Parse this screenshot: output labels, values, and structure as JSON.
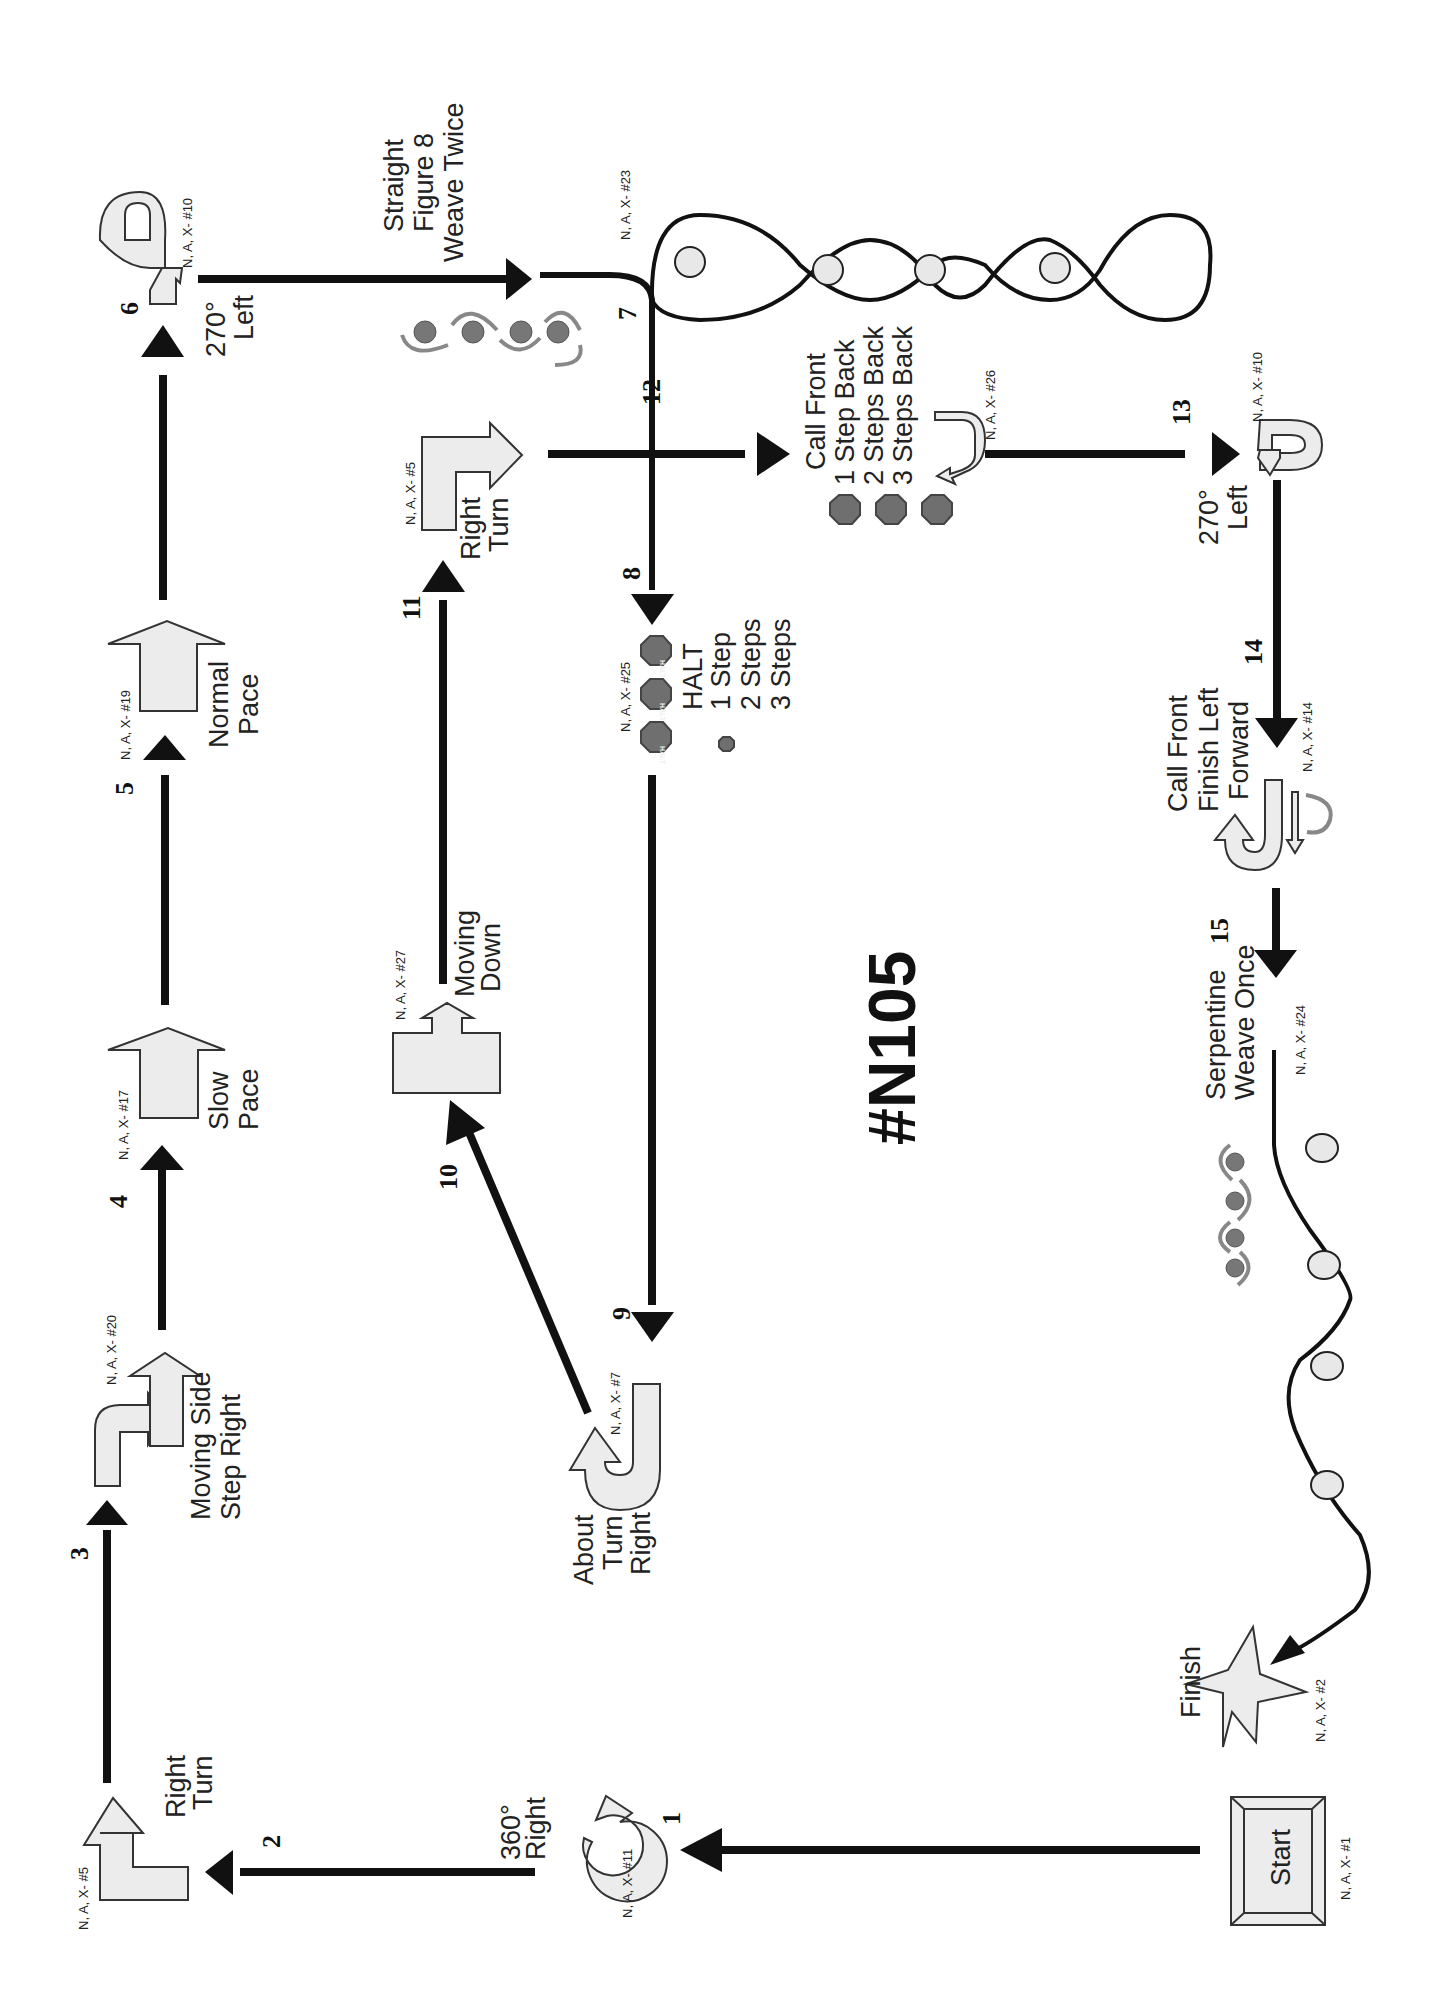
{
  "course": {
    "title": "#N105"
  },
  "stations": [
    {
      "step": "1",
      "name": "Start",
      "code": "N, A, X- #1"
    },
    {
      "step": "2",
      "name": "360° Right",
      "line1": "360°",
      "line2": "Right",
      "code": "N, A, X- #11"
    },
    {
      "step": "3",
      "name": "Right Turn",
      "line1": "Right",
      "line2": "Turn",
      "code": "N, A, X- #5"
    },
    {
      "step": "4",
      "name": "Moving Side Step Right",
      "line1": "Moving Side",
      "line2": "Step Right",
      "code": "N, A, X- #20"
    },
    {
      "step": "5",
      "name": "Slow Pace",
      "line1": "Slow",
      "line2": "Pace",
      "code": "N, A, X- #17"
    },
    {
      "step": "6",
      "name": "Normal Pace",
      "line1": "Normal",
      "line2": "Pace",
      "code": "N, A, X- #19"
    },
    {
      "step": "7",
      "name": "270° Left",
      "line1": "270°",
      "line2": "Left",
      "code": "N, A, X- #10"
    },
    {
      "step": "8",
      "name": "Straight Figure 8 Weave Twice",
      "line1": "Straight",
      "line2": "Figure 8",
      "line3": "Weave  Twice",
      "code": "N, A, X- #23"
    },
    {
      "step": "9",
      "name": "HALT 1 Step 2 Steps 3 Steps",
      "line1": "HALT",
      "line2": "1 Step",
      "line3": "2 Steps",
      "line4": "3 Steps",
      "code": "N, A, X- #25"
    },
    {
      "step": "10",
      "name": "About Turn Right",
      "line1": "About",
      "line2": "Turn",
      "line3": "Right",
      "code": "N, A, X- #7"
    },
    {
      "step": "11",
      "name": "Moving Down",
      "line1": "Moving",
      "line2": "Down",
      "code": "N, A, X- #27"
    },
    {
      "step": "12",
      "name": "Right Turn",
      "line1": "Right",
      "line2": "Turn",
      "code": "N, A, X- #5"
    },
    {
      "step": "13",
      "name": "Call Front 1 Step Back 2 Steps Back 3 Steps Back",
      "line1": "Call Front",
      "line2": "1 Step Back",
      "line3": "2 Steps Back",
      "line4": "3 Steps Back",
      "code": "N, A, X- #26"
    },
    {
      "step": "14",
      "name": "270° Left",
      "line1": "270°",
      "line2": "Left",
      "code": "N, A, X- #10"
    },
    {
      "step": "15",
      "name": "Call Front Finish Left Forward",
      "line1": "Call Front",
      "line2": "Finish Left",
      "line3": "Forward",
      "code": "N, A, X- #14"
    },
    {
      "name": "Serpentine Weave Once",
      "line1": "Serpentine",
      "line2": "Weave Once",
      "code": "N, A, X- #24"
    },
    {
      "name": "Finish",
      "line1": "Finish",
      "code": "N, A, X- #2"
    }
  ],
  "step_numbers": [
    "1",
    "2",
    "3",
    "4",
    "5",
    "6",
    "7",
    "8",
    "9",
    "10",
    "11",
    "12",
    "13",
    "14",
    "15"
  ],
  "halt_sign": "HALT",
  "colors": {
    "sign_fill": "#ececec",
    "line": "#111111",
    "halt": "#6f6f6f",
    "dog": "#777777"
  }
}
